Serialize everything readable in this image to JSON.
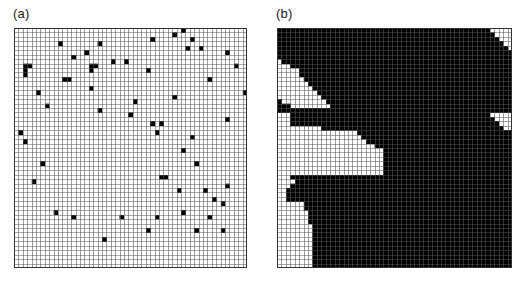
{
  "figure": {
    "background_color": "#ffffff",
    "width": 532,
    "height": 288
  },
  "style": {
    "grid_line_color": "#555555",
    "cell_fill_color": "#000000",
    "cell_empty_color": "#ffffff",
    "border_color": "#333333",
    "label_color": "#1a1a1a"
  },
  "panels": [
    {
      "id": "a",
      "label": "(a)",
      "grid": {
        "columns": 53,
        "rows": 54,
        "cell_px": 4.4,
        "filled_count": 62,
        "pattern": "scattered-isolated-cells",
        "filled_cells": [
          [
            38,
            0
          ],
          [
            36,
            1
          ],
          [
            10,
            3
          ],
          [
            40,
            2
          ],
          [
            2,
            8
          ],
          [
            3,
            8
          ],
          [
            2,
            9
          ],
          [
            2,
            10
          ],
          [
            19,
            3
          ],
          [
            31,
            2
          ],
          [
            42,
            4
          ],
          [
            16,
            5
          ],
          [
            13,
            6
          ],
          [
            39,
            4
          ],
          [
            48,
            5
          ],
          [
            25,
            7
          ],
          [
            17,
            8
          ],
          [
            18,
            8
          ],
          [
            17,
            9
          ],
          [
            50,
            8
          ],
          [
            30,
            9
          ],
          [
            11,
            11
          ],
          [
            12,
            11
          ],
          [
            22,
            7
          ],
          [
            44,
            11
          ],
          [
            5,
            14
          ],
          [
            17,
            13
          ],
          [
            52,
            14
          ],
          [
            27,
            16
          ],
          [
            36,
            15
          ],
          [
            19,
            18
          ],
          [
            7,
            17
          ],
          [
            26,
            19
          ],
          [
            31,
            21
          ],
          [
            33,
            21
          ],
          [
            48,
            20
          ],
          [
            1,
            23
          ],
          [
            32,
            23
          ],
          [
            53,
            21
          ],
          [
            2,
            25
          ],
          [
            40,
            24
          ],
          [
            38,
            27
          ],
          [
            6,
            30
          ],
          [
            41,
            30
          ],
          [
            4,
            34
          ],
          [
            33,
            33
          ],
          [
            34,
            33
          ],
          [
            37,
            36
          ],
          [
            43,
            36
          ],
          [
            48,
            35
          ],
          [
            45,
            38
          ],
          [
            47,
            39
          ],
          [
            9,
            41
          ],
          [
            13,
            42
          ],
          [
            24,
            42
          ],
          [
            32,
            42
          ],
          [
            38,
            41
          ],
          [
            44,
            42
          ],
          [
            30,
            45
          ],
          [
            41,
            45
          ],
          [
            47,
            45
          ],
          [
            20,
            47
          ]
        ]
      }
    },
    {
      "id": "b",
      "label": "(b)",
      "grid": {
        "columns": 53,
        "rows": 54,
        "cell_px": 4.42,
        "pattern": "dendritic-channel-network",
        "description": "Connected black cells forming branching drainage channels converging toward the lower right"
      }
    }
  ]
}
